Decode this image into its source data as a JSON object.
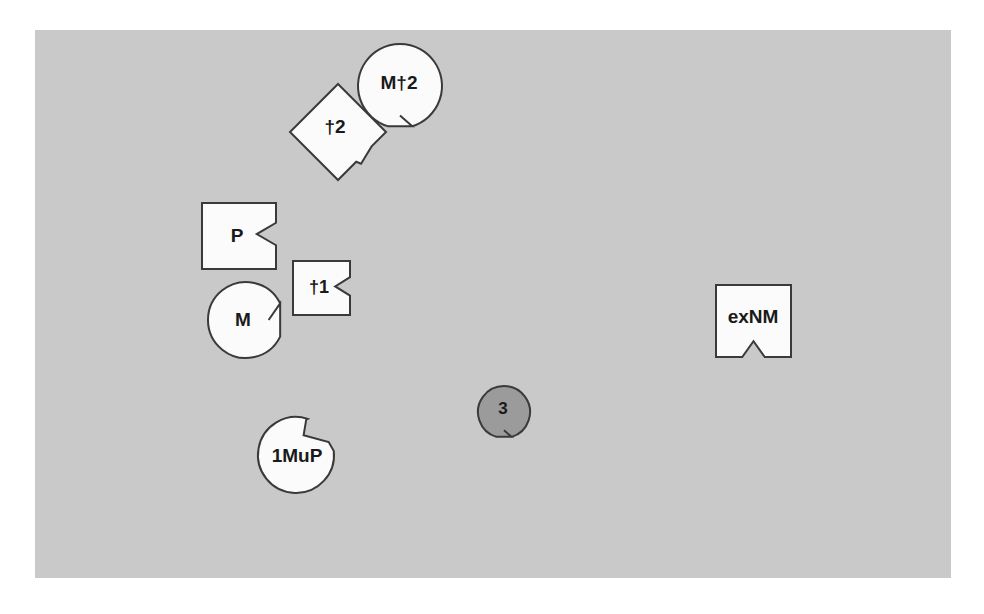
{
  "canvas": {
    "background_color": "#c9c9c9",
    "page_background_color": "#ffffff",
    "x": 35,
    "y": 30,
    "width": 916,
    "height": 548
  },
  "style": {
    "shape_fill_light": "#fbfbfb",
    "shape_fill_gray": "#9b9b9b",
    "shape_stroke": "#3a3a3a",
    "label_color": "#1a1a1a"
  },
  "shapes": [
    {
      "id": "m-dagger-2",
      "label": "M†2",
      "kind": "circle-notched",
      "notch_position": "bottom",
      "fill": "#fbfbfb",
      "cx": 400,
      "cy": 86,
      "r": 42,
      "label_x": 399,
      "label_y": 84,
      "font_size": 19
    },
    {
      "id": "dagger-2",
      "label": "†2",
      "kind": "diamond-notched",
      "notch_position": "lower-right",
      "fill": "#fbfbfb",
      "cx": 338,
      "cy": 132,
      "r": 48,
      "label_x": 335,
      "label_y": 128,
      "font_size": 19
    },
    {
      "id": "p",
      "label": "P",
      "kind": "rect-notched",
      "notch_position": "right",
      "fill": "#fbfbfb",
      "x": 202,
      "y": 203,
      "width": 74,
      "height": 66,
      "label_x": 237,
      "label_y": 237,
      "font_size": 19
    },
    {
      "id": "dagger-1",
      "label": "†1",
      "kind": "rect-notched",
      "notch_position": "right",
      "fill": "#fbfbfb",
      "x": 293,
      "y": 261,
      "width": 57,
      "height": 54,
      "label_x": 319,
      "label_y": 288,
      "font_size": 18
    },
    {
      "id": "m",
      "label": "M",
      "kind": "circle-notched",
      "notch_position": "right",
      "fill": "#fbfbfb",
      "cx": 246,
      "cy": 320,
      "r": 38,
      "label_x": 243,
      "label_y": 321,
      "font_size": 19
    },
    {
      "id": "one-mu-p",
      "label": "1MuP",
      "kind": "circle-step-notched",
      "notch_position": "upper-right",
      "fill": "#fbfbfb",
      "cx": 296,
      "cy": 455,
      "r": 38,
      "label_x": 297,
      "label_y": 457,
      "font_size": 19
    },
    {
      "id": "three",
      "label": "3",
      "kind": "circle-notched",
      "notch_position": "bottom",
      "fill": "#9b9b9b",
      "cx": 504,
      "cy": 412,
      "r": 26,
      "label_x": 503,
      "label_y": 410,
      "font_size": 17
    },
    {
      "id": "ex-nm",
      "label": "exNM",
      "kind": "rect-notched",
      "notch_position": "bottom",
      "fill": "#fbfbfb",
      "x": 716,
      "y": 285,
      "width": 75,
      "height": 72,
      "label_x": 753,
      "label_y": 318,
      "font_size": 19
    }
  ]
}
